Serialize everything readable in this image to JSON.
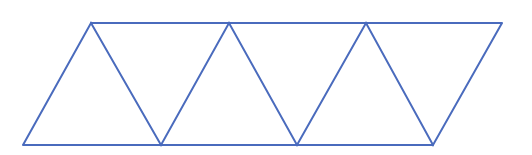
{
  "diagram": {
    "type": "triangle-strip-parallelogram",
    "stroke_color": "#4a6bbd",
    "stroke_width": 2,
    "top_edge": {
      "x1": 91,
      "y1": 23,
      "x2": 502,
      "y2": 23
    },
    "bottom_edge": {
      "x1": 23,
      "y1": 145,
      "x2": 433,
      "y2": 145
    },
    "zigzag_points": "23,145 91,23 161,145 229,23 297,145 366,23 433,145 502,23",
    "triangle_count": 7
  }
}
